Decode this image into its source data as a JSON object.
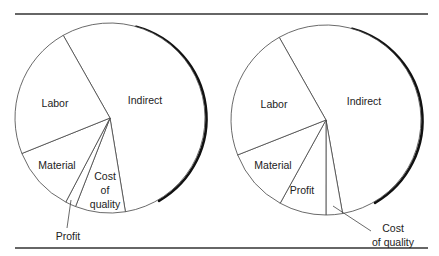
{
  "chart_data": [
    {
      "type": "pie",
      "title": "",
      "start": "top",
      "direction": "clockwise-from-labor-boundary",
      "slices": [
        {
          "name": "Indirect",
          "value": 55.6
        },
        {
          "name": "Cost of quality",
          "value": 8.5
        },
        {
          "name": "Profit",
          "value": 1.8
        },
        {
          "name": "Material",
          "value": 11.2
        },
        {
          "name": "Labor",
          "value": 22.9
        }
      ],
      "labels": [
        {
          "slice": "Labor",
          "lines": [
            "Labor"
          ],
          "placement": "inside"
        },
        {
          "slice": "Indirect",
          "lines": [
            "Indirect"
          ],
          "placement": "inside"
        },
        {
          "slice": "Material",
          "lines": [
            "Material"
          ],
          "placement": "inside"
        },
        {
          "slice": "Cost of quality",
          "lines": [
            "Cost",
            "of",
            "quality"
          ],
          "placement": "inside"
        },
        {
          "slice": "Profit",
          "lines": [
            "Profit"
          ],
          "placement": "outside-with-leader"
        }
      ]
    },
    {
      "type": "pie",
      "title": "",
      "start": "top",
      "direction": "clockwise-from-labor-boundary",
      "slices": [
        {
          "name": "Indirect",
          "value": 55.4
        },
        {
          "name": "Cost of quality",
          "value": 2.8
        },
        {
          "name": "Profit",
          "value": 8.0
        },
        {
          "name": "Material",
          "value": 11.0
        },
        {
          "name": "Labor",
          "value": 22.8
        }
      ],
      "labels": [
        {
          "slice": "Labor",
          "lines": [
            "Labor"
          ],
          "placement": "inside"
        },
        {
          "slice": "Indirect",
          "lines": [
            "Indirect"
          ],
          "placement": "inside"
        },
        {
          "slice": "Material",
          "lines": [
            "Material"
          ],
          "placement": "inside"
        },
        {
          "slice": "Profit",
          "lines": [
            "Profit"
          ],
          "placement": "inside"
        },
        {
          "slice": "Cost of quality",
          "lines": [
            "Cost",
            "of quality"
          ],
          "placement": "outside-with-leader"
        }
      ]
    }
  ]
}
